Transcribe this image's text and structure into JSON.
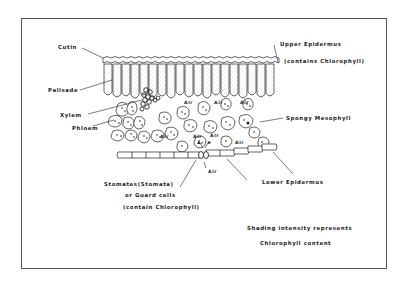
{
  "diagram": {
    "type": "leaf-cross-section",
    "labels": {
      "cutin": "Cutin",
      "upper_epidermis": "Upper Epidermus",
      "upper_epidermis_note": "(contains Chlorophyll)",
      "palisade": "Palisade",
      "xylem": "Xylem",
      "phloem": "Phloem",
      "spongy_mesophyll": "Spongy Mesophyll",
      "stomates": "Stomates(Stomata)",
      "or_guard_cells": "or Guard cells",
      "guard_cells_note": "(contain Chlorophyll)",
      "lower_epidermis": "Lower Epidermus",
      "air": "Air",
      "legend_line1": "Shading intensity represents",
      "legend_line2": "Chlorophyll content"
    }
  }
}
